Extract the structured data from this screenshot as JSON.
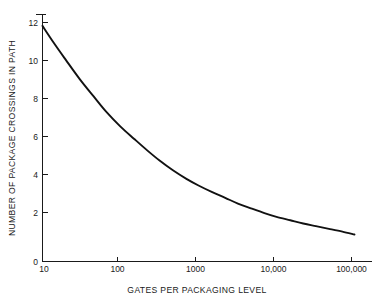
{
  "chart_data": {
    "type": "line",
    "title": "",
    "xlabel": "GATES PER PACKAGING LEVEL",
    "ylabel": "NUMBER OF PACKAGE CROSSINGS IN PATH",
    "xscale": "log",
    "yscale": "linear",
    "xlim": [
      10,
      100000
    ],
    "ylim": [
      0,
      12.4
    ],
    "grid": false,
    "legend": null,
    "x_tick_labels": [
      "10",
      "100",
      "1000",
      "10,000",
      "100,000"
    ],
    "x_tick_values": [
      10,
      100,
      1000,
      10000,
      100000
    ],
    "y_tick_labels": [
      "0",
      "2",
      "4",
      "6",
      "8",
      "10",
      "12"
    ],
    "y_tick_values": [
      0,
      2,
      4,
      6,
      8,
      10,
      12
    ],
    "series": [
      {
        "name": "package crossings",
        "x": [
          10,
          14,
          20,
          30,
          45,
          65,
          100,
          150,
          220,
          320,
          470,
          700,
          1000,
          1500,
          2200,
          3200,
          4700,
          7000,
          10000,
          15000,
          22000,
          32000,
          47000,
          70000,
          100000
        ],
        "y": [
          12.4,
          11.5,
          10.6,
          9.6,
          8.7,
          7.9,
          7.1,
          6.45,
          5.85,
          5.3,
          4.8,
          4.35,
          4.0,
          3.65,
          3.35,
          3.05,
          2.8,
          2.55,
          2.35,
          2.17,
          2.0,
          1.86,
          1.72,
          1.57,
          1.42
        ]
      }
    ],
    "curve_start": {
      "x": 10,
      "y": 12.4
    },
    "curve_end": {
      "x": 100000,
      "y": 1.42
    },
    "line_color": "#111111",
    "axis_color": "#1a1a1a",
    "background_color": "#ffffff"
  }
}
